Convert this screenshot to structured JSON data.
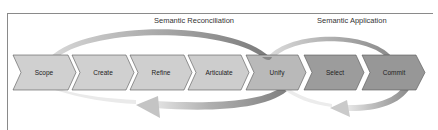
{
  "diagram": {
    "phases": [
      {
        "label": "Semantic Reconciliation"
      },
      {
        "label": "Semantic Application"
      }
    ],
    "steps": [
      {
        "label": "Scope",
        "color": "#d0d0d0"
      },
      {
        "label": "Create",
        "color": "#d0d0d0"
      },
      {
        "label": "Refine",
        "color": "#cfcfcf"
      },
      {
        "label": "Articulate",
        "color": "#cdcdcd"
      },
      {
        "label": "Unify",
        "color": "#b9b9b9"
      },
      {
        "label": "Select",
        "color": "#9c9c9c"
      },
      {
        "label": "Commit",
        "color": "#979797"
      }
    ],
    "colors": {
      "frame": "#8a8a8a",
      "arc_dark": "#7a7a7a",
      "arc_light": "#e2e2e2",
      "chevron_border": "#555555"
    }
  }
}
